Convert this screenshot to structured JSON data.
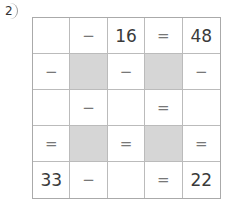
{
  "problem": {
    "label": "2"
  },
  "grid": {
    "rows": [
      [
        {
          "v": "",
          "t": "blank"
        },
        {
          "v": "−",
          "t": "op"
        },
        {
          "v": "16",
          "t": "num"
        },
        {
          "v": "=",
          "t": "op"
        },
        {
          "v": "48",
          "t": "num"
        }
      ],
      [
        {
          "v": "−",
          "t": "op"
        },
        {
          "v": "",
          "t": "shaded"
        },
        {
          "v": "−",
          "t": "op"
        },
        {
          "v": "",
          "t": "shaded"
        },
        {
          "v": "−",
          "t": "op"
        }
      ],
      [
        {
          "v": "",
          "t": "blank"
        },
        {
          "v": "−",
          "t": "op"
        },
        {
          "v": "",
          "t": "blank"
        },
        {
          "v": "=",
          "t": "op"
        },
        {
          "v": "",
          "t": "blank"
        }
      ],
      [
        {
          "v": "=",
          "t": "op"
        },
        {
          "v": "",
          "t": "shaded"
        },
        {
          "v": "=",
          "t": "op"
        },
        {
          "v": "",
          "t": "shaded"
        },
        {
          "v": "=",
          "t": "op"
        }
      ],
      [
        {
          "v": "33",
          "t": "num"
        },
        {
          "v": "−",
          "t": "op"
        },
        {
          "v": "",
          "t": "blank"
        },
        {
          "v": "=",
          "t": "op"
        },
        {
          "v": "22",
          "t": "num"
        }
      ]
    ]
  },
  "colors": {
    "shaded": "#d6d6d6",
    "grid_line": "#bbbbbb",
    "text": "#3a3a3a"
  }
}
